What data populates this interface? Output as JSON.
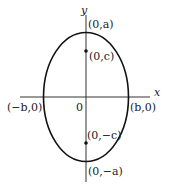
{
  "diagram": {
    "type": "ellipse-vertical-major-axis",
    "axes": {
      "x_label": "x",
      "y_label": "y",
      "origin_label": "0"
    },
    "points": {
      "top_vertex": "(0,a)",
      "bottom_vertex": "(0,−a)",
      "upper_focus": "(0,c)",
      "lower_focus": "(0,−c)",
      "left_covertex": "(−b,0)",
      "right_covertex": "(b,0)"
    },
    "colors": {
      "curve": "#111111",
      "axis": "#333333",
      "text": "#222222"
    }
  }
}
